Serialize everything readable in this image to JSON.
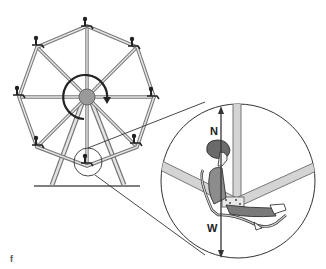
{
  "figure": {
    "labels": {
      "normal_force": "N",
      "weight": "W"
    },
    "corner_mark": "f",
    "colors": {
      "frame": "#8a8a8a",
      "frame_fill": "#d4d4d4",
      "hub": "#9a9a9a",
      "outline": "#222222",
      "rider_hair": "#6a6a6a",
      "rider_shirt": "#8c8c8c",
      "rider_pants": "#7a7a7a",
      "background": "#ffffff"
    },
    "wheel": {
      "spokes": 8,
      "gondolas": 8,
      "rotation_arrow": "clockwise"
    }
  }
}
